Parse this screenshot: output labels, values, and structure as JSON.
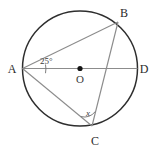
{
  "figure": {
    "kind": "circle-geometry-diagram",
    "background_color": "#ffffff",
    "width": 160,
    "height": 151
  },
  "circle": {
    "name": "circumscribed-circle",
    "center_x": 80,
    "center_y": 68.5,
    "radius": 57.5,
    "stroke_color": "#2e2e2e",
    "stroke_width": 1.5,
    "fill": "none"
  },
  "center_point": {
    "label": "O",
    "x": 80,
    "y": 68.5,
    "dot_radius": 2.6,
    "dot_color": "#151515",
    "label_x": 80,
    "label_y": 83
  },
  "points": [
    {
      "id": "A",
      "label": "A",
      "x": 22.5,
      "y": 68.5,
      "label_x": 12,
      "label_y": 72.5
    },
    {
      "id": "B",
      "label": "B",
      "x": 118,
      "y": 22,
      "label_x": 124,
      "label_y": 17
    },
    {
      "id": "C",
      "label": "C",
      "x": 92,
      "y": 126,
      "label_x": 95,
      "label_y": 145
    },
    {
      "id": "D",
      "label": "D",
      "x": 137.5,
      "y": 68.5,
      "label_x": 144,
      "label_y": 72.5
    }
  ],
  "segments": [
    {
      "id": "AD",
      "name": "diameter-a-to-d",
      "from": "A",
      "to": "D",
      "x1": 22.5,
      "y1": 68.5,
      "x2": 137.5,
      "y2": 68.5,
      "stroke_color": "#8c8c8c",
      "stroke_width": 1.1
    },
    {
      "id": "AB",
      "name": "chord-a-to-b",
      "from": "A",
      "to": "B",
      "x1": 22.5,
      "y1": 68.5,
      "x2": 118,
      "y2": 22,
      "stroke_color": "#8c8c8c",
      "stroke_width": 1.1
    },
    {
      "id": "AC",
      "name": "chord-a-to-c",
      "from": "A",
      "to": "C",
      "x1": 22.5,
      "y1": 68.5,
      "x2": 92,
      "y2": 126,
      "stroke_color": "#8c8c8c",
      "stroke_width": 1.1
    },
    {
      "id": "BC",
      "name": "chord-b-to-c",
      "from": "B",
      "to": "C",
      "x1": 118,
      "y1": 22,
      "x2": 92,
      "y2": 126,
      "stroke_color": "#8c8c8c",
      "stroke_width": 1.1
    }
  ],
  "angles": [
    {
      "id": "angle-at-A",
      "vertex": "A",
      "label": "25°",
      "value": 25,
      "unit": "degrees",
      "between": [
        "AB",
        "AD"
      ],
      "label_x": 40,
      "label_y": 64,
      "arc_path": "M 45.5 64.5 A 23 23 0 0 1 45.5 73.2",
      "arc_color": "#6f6f6f"
    },
    {
      "id": "angle-at-C",
      "vertex": "C",
      "label": "x",
      "value": null,
      "unit": "unknown",
      "between": [
        "CA",
        "CB"
      ],
      "label_x": 88,
      "label_y": 116,
      "arc_path": "M 80.8 116.6 A 14.5 14.5 0 0 0 95.2 111.7",
      "arc_color": "#6f6f6f"
    }
  ]
}
